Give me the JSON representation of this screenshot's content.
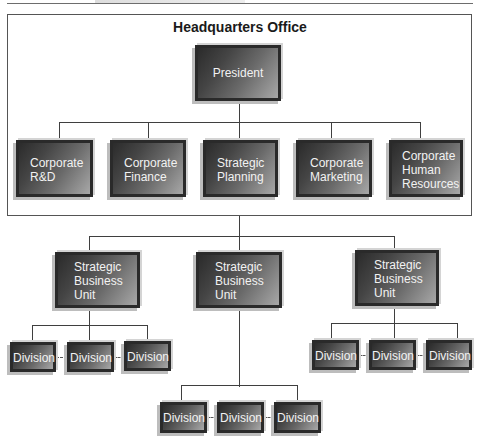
{
  "diagram": {
    "type": "org-chart",
    "frame_title": "Headquarters Office",
    "root": {
      "label": "President"
    },
    "corporate_staff": [
      {
        "label": "Corporate\nR&D"
      },
      {
        "label": "Corporate\nFinance"
      },
      {
        "label": "Strategic\nPlanning"
      },
      {
        "label": "Corporate\nMarketing"
      },
      {
        "label": "Corporate\nHuman\nResources"
      }
    ],
    "business_units": [
      {
        "label": "Strategic\nBusiness\nUnit",
        "divisions": [
          "Division",
          "Division",
          "Division"
        ]
      },
      {
        "label": "Strategic\nBusiness\nUnit",
        "divisions": [
          "Division",
          "Division",
          "Division"
        ]
      },
      {
        "label": "Strategic\nBusiness\nUnit",
        "divisions": [
          "Division",
          "Division",
          "Division"
        ]
      }
    ],
    "colors": {
      "box_dark": "#2b2b2b",
      "box_light": "#a8a8a8",
      "box_text": "#f2f2f2",
      "line": "#3f3f3f",
      "shadow": "#bdbdbd"
    }
  }
}
